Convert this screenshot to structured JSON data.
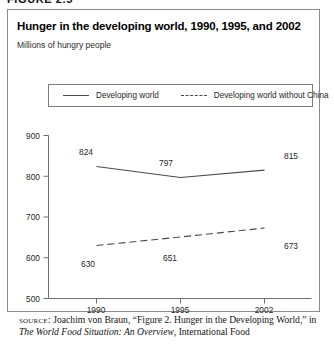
{
  "figure": {
    "number_label": "FIGURE 2.5"
  },
  "chart_panel": {
    "title": "Hunger in the developing world, 1990, 1995, and 2002",
    "subtitle": "Millions of hungry people"
  },
  "source": {
    "label": "SOURCE:",
    "text_before_italic": " Joachim von Braun, “Figure 2. Hunger in the Developing World,” in ",
    "italic_title": "The World Food Situation: An Overview",
    "text_after_italic": ", International Food"
  },
  "chart_data": {
    "type": "line",
    "title": "Hunger in the developing world, 1990, 1995, and 2002",
    "subtitle": "Millions of hungry people",
    "xlabel": "",
    "ylabel": "Millions of hungry people",
    "categories": [
      "1990",
      "1995",
      "2002"
    ],
    "x_tick_labels": [
      "1990",
      "1995",
      "2002"
    ],
    "y_tick_labels": [
      "500",
      "600",
      "700",
      "800",
      "900"
    ],
    "y_ticks": [
      500,
      600,
      700,
      800,
      900
    ],
    "ylim": [
      500,
      900
    ],
    "grid": false,
    "legend_position": "top",
    "series": [
      {
        "name": "Developing world",
        "style": "solid",
        "color": "#4a4a4a",
        "values": [
          824,
          797,
          815
        ],
        "labels": [
          "824",
          "797",
          "815"
        ]
      },
      {
        "name": "Developing world without China",
        "style": "dashed",
        "color": "#4a4a4a",
        "values": [
          630,
          651,
          673
        ],
        "labels": [
          "630",
          "651",
          "673"
        ]
      }
    ]
  }
}
